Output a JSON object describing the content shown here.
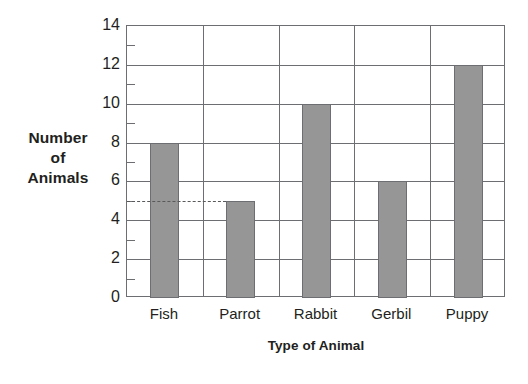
{
  "chart_data": {
    "type": "bar",
    "title": "",
    "xlabel": "Type of Animal",
    "ylabel": "Number of Animals",
    "ylabel_lines": [
      "Number",
      "of",
      "Animals"
    ],
    "categories": [
      "Fish",
      "Parrot",
      "Rabbit",
      "Gerbil",
      "Puppy"
    ],
    "values": [
      8,
      5,
      10,
      6,
      12
    ],
    "ylim": [
      0,
      14
    ],
    "y_major_ticks": [
      0,
      2,
      4,
      6,
      8,
      10,
      12,
      14
    ],
    "y_minor_ticks": [
      1,
      3,
      5,
      7,
      9,
      11,
      13
    ],
    "y_tick_labels": [
      "0",
      "2",
      "4",
      "6",
      "8",
      "10",
      "12",
      "14"
    ],
    "grid": true,
    "legend": null,
    "annotations": [
      {
        "type": "dashed-reference-line",
        "value": 5,
        "from_category": "axis",
        "to_category": "Parrot",
        "label": ""
      }
    ],
    "colors": {
      "bar_fill": "#969696",
      "bar_stroke": "#6d6e71",
      "axis": "#6d6e71",
      "grid": "#6d6e71",
      "text": "#231f20",
      "background": "#ffffff",
      "reference_line": "#58595b"
    }
  }
}
